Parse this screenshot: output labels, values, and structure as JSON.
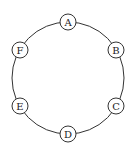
{
  "diagram": {
    "type": "cycle-graph",
    "ring": {
      "cx": 68,
      "cy": 78,
      "r": 56
    },
    "node_radius": 8,
    "nodes": [
      {
        "label": "A",
        "x": 68,
        "y": 22
      },
      {
        "label": "B",
        "x": 116,
        "y": 50
      },
      {
        "label": "C",
        "x": 116,
        "y": 106
      },
      {
        "label": "D",
        "x": 68,
        "y": 134
      },
      {
        "label": "E",
        "x": 20,
        "y": 106
      },
      {
        "label": "F",
        "x": 20,
        "y": 50
      }
    ],
    "edges": [
      [
        "A",
        "B"
      ],
      [
        "B",
        "C"
      ],
      [
        "C",
        "D"
      ],
      [
        "D",
        "E"
      ],
      [
        "E",
        "F"
      ],
      [
        "F",
        "A"
      ]
    ]
  }
}
